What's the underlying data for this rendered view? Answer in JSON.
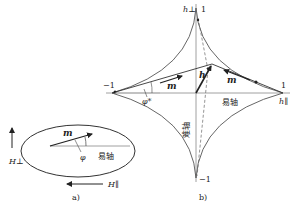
{
  "panel_a": {
    "caption": "a)",
    "m_label": "m",
    "phi_label": "φ",
    "easy_axis_label": "易轴",
    "h_perp_label": "H⊥",
    "h_par_label": "H∥"
  },
  "panel_b": {
    "caption": "b)",
    "h_perp_label": "h⊥",
    "h_par_label": "h∥",
    "top_tick": "1",
    "bottom_tick": "−1",
    "left_tick": "−1",
    "right_tick": "1",
    "h_label": "h",
    "m_left_label": "m",
    "m_right_label": "m",
    "phi_star_label": "φ*",
    "easy_axis_label": "易轴",
    "hard_axis_label": "难轴"
  },
  "colors": {
    "line": "#333333",
    "curve": "#555555",
    "axis": "#888888",
    "background": "#ffffff"
  }
}
